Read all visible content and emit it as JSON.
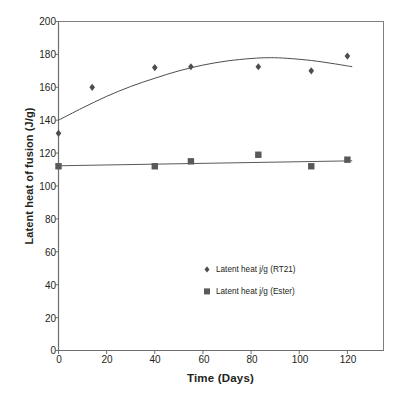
{
  "chart_data": {
    "type": "scatter",
    "title": "",
    "xlabel": "Time (Days)",
    "ylabel": "Latent heat of fusion (J/g)",
    "xlim": [
      0,
      135
    ],
    "ylim": [
      0,
      200
    ],
    "xticks": [
      0,
      20,
      40,
      60,
      80,
      100,
      120
    ],
    "yticks": [
      0,
      20,
      40,
      60,
      80,
      100,
      120,
      140,
      160,
      180,
      200
    ],
    "grid": false,
    "legend_position": "inside-lower-right",
    "series": [
      {
        "name": "Latent heat j/g (RT21)",
        "marker": "diamond",
        "color": "#4d4d4d",
        "x": [
          0,
          14,
          40,
          55,
          83,
          105,
          120
        ],
        "values": [
          132,
          160,
          172,
          172.5,
          172.5,
          170,
          179
        ],
        "trendline": {
          "type": "polynomial",
          "x": [
            0,
            10,
            20,
            30,
            40,
            50,
            60,
            70,
            80,
            88,
            95,
            105,
            115,
            122
          ],
          "values": [
            140,
            147.5,
            154.5,
            160.5,
            165.5,
            170,
            173.5,
            176,
            177.5,
            178,
            177.6,
            176.3,
            174.2,
            172.5
          ]
        }
      },
      {
        "name": "Latent heat j/g (Ester)",
        "marker": "square",
        "color": "#595959",
        "x": [
          0,
          40,
          55,
          83,
          105,
          120
        ],
        "values": [
          112,
          112,
          115,
          119,
          112,
          116
        ],
        "trendline": {
          "type": "linear",
          "x": [
            0,
            122
          ],
          "values": [
            112.3,
            115.3
          ]
        }
      }
    ],
    "legend": [
      {
        "label": "Latent heat j/g (RT21)",
        "marker": "diamond"
      },
      {
        "label": "Latent heat j/g (Ester)",
        "marker": "square"
      }
    ],
    "axis_color": "#808080",
    "text_color": "#231f20",
    "background": "#ffffff"
  }
}
